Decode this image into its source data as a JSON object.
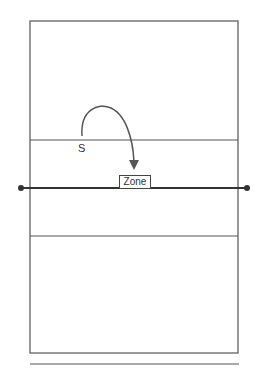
{
  "diagram": {
    "type": "volleyball-court",
    "labels": {
      "player": "S",
      "target": "Zone"
    },
    "colors": {
      "lines": "#555555",
      "net": "#333333",
      "arrow": "#555555",
      "background": "#ffffff"
    }
  }
}
